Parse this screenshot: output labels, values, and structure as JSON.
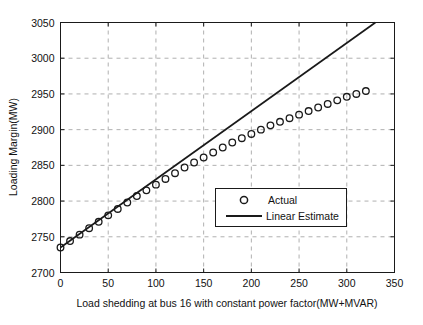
{
  "chart_data": {
    "type": "line",
    "title": "",
    "xlabel": "Load shedding at bus 16 with constant power factor(MW+MVAR)",
    "ylabel": "Loading Margin(MW)",
    "xlim": [
      0,
      350
    ],
    "ylim": [
      2700,
      3050
    ],
    "xticks": [
      0,
      50,
      100,
      150,
      200,
      250,
      300,
      350
    ],
    "xtick_labels": [
      "0",
      "50",
      "100",
      "150",
      "200",
      "250",
      "300",
      "350"
    ],
    "yticks": [
      2700,
      2750,
      2800,
      2850,
      2900,
      2950,
      3000,
      3050
    ],
    "ytick_labels": [
      "2700",
      "2750",
      "2800",
      "2850",
      "2900",
      "2950",
      "3000",
      "3050"
    ],
    "grid": true,
    "grid_style": "dashed",
    "grid_color": "#b0b0b0",
    "legend_position": "center-right",
    "series": [
      {
        "name": "Actual",
        "marker": "circle-open",
        "color": "#1a1a1a",
        "x": [
          0,
          10,
          20,
          30,
          40,
          50,
          60,
          70,
          80,
          90,
          100,
          110,
          120,
          130,
          140,
          150,
          160,
          170,
          180,
          190,
          200,
          210,
          220,
          230,
          240,
          250,
          260,
          270,
          280,
          290,
          300,
          310,
          320
        ],
        "values": [
          2735,
          2744,
          2753,
          2762,
          2771,
          2780,
          2789,
          2798,
          2807,
          2815,
          2823,
          2831,
          2839,
          2847,
          2854,
          2861,
          2868,
          2875,
          2882,
          2888,
          2894,
          2900,
          2906,
          2911,
          2916,
          2921,
          2926,
          2931,
          2936,
          2941,
          2946,
          2950,
          2954
        ]
      },
      {
        "name": "Linear Estimate",
        "marker": "none",
        "color": "#1a1a1a",
        "x": [
          0,
          330
        ],
        "values": [
          2735,
          3050
        ]
      }
    ]
  },
  "axes": {
    "xlabel": "Load shedding at bus 16 with constant power factor(MW+MVAR)",
    "ylabel": "Loading Margin(MW)"
  },
  "legend": {
    "entries": [
      {
        "label": "Actual",
        "marker": "circle-open"
      },
      {
        "label": "Linear Estimate",
        "marker": "line"
      }
    ]
  }
}
